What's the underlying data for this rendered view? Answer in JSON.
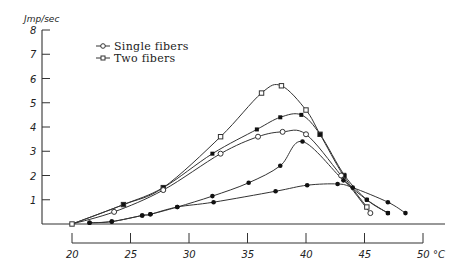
{
  "chart_data": {
    "type": "line",
    "title": "",
    "xlabel": "°C",
    "ylabel": "Jmp/sec",
    "xlim": [
      20,
      50
    ],
    "ylim": [
      0,
      8
    ],
    "xticks": [
      20,
      25,
      30,
      35,
      40,
      45,
      50
    ],
    "xtick_labels": [
      "20",
      "25",
      "30",
      "35",
      "40",
      "45",
      "50 °C"
    ],
    "yticks": [
      1,
      2,
      3,
      4,
      5,
      6,
      7,
      8
    ],
    "ytick_labels": [
      "1",
      "2",
      "3",
      "4",
      "5",
      "6",
      "7",
      "8"
    ],
    "grid": false,
    "legend": {
      "placement": "top-left",
      "entries": [
        {
          "label": "Single fibers",
          "marker": "open-circle"
        },
        {
          "label": "Two fibers",
          "marker": "open-square"
        }
      ]
    },
    "series": [
      {
        "name": "Two fibers",
        "marker": "open-square",
        "x": [
          20,
          24.4,
          27.8,
          32.7,
          36.2,
          37.9,
          40.0,
          41.2,
          43.2,
          45.2
        ],
        "y": [
          0,
          0.8,
          1.5,
          3.6,
          5.4,
          5.7,
          4.7,
          3.7,
          2.0,
          0.7
        ]
      },
      {
        "name": "Two fibers (filled)",
        "marker": "filled-square",
        "x": [
          20,
          24.4,
          27.8,
          32.0,
          35.8,
          37.8,
          39.6,
          41.2,
          43.3,
          45.2,
          47.0
        ],
        "y": [
          0,
          0.8,
          1.5,
          2.9,
          3.9,
          4.4,
          4.5,
          3.7,
          2.0,
          1.0,
          0.45
        ]
      },
      {
        "name": "Single fibers",
        "marker": "open-circle",
        "x": [
          20,
          23.6,
          27.8,
          32.7,
          35.9,
          38.0,
          40.0,
          43.0,
          45.5
        ],
        "y": [
          0,
          0.5,
          1.4,
          2.9,
          3.6,
          3.8,
          3.7,
          2.0,
          0.45
        ]
      },
      {
        "name": "Single fibers (filled, steep)",
        "marker": "filled-circle",
        "x": [
          21.5,
          23.4,
          26.0,
          26.7,
          29.0,
          32.0,
          35.1,
          37.8,
          39.7,
          43.2,
          45.2,
          47.0
        ],
        "y": [
          0.05,
          0.1,
          0.35,
          0.4,
          0.7,
          1.15,
          1.7,
          2.4,
          3.4,
          1.8,
          1.0,
          0.45
        ]
      },
      {
        "name": "Single fibers (filled, flat)",
        "marker": "filled-circle",
        "x": [
          21.5,
          23.4,
          26.0,
          26.7,
          29.0,
          32.1,
          37.4,
          40.1,
          42.7,
          44.0,
          47.0,
          48.5
        ],
        "y": [
          0.05,
          0.1,
          0.35,
          0.4,
          0.7,
          0.9,
          1.35,
          1.6,
          1.65,
          1.5,
          0.9,
          0.45
        ]
      }
    ]
  }
}
